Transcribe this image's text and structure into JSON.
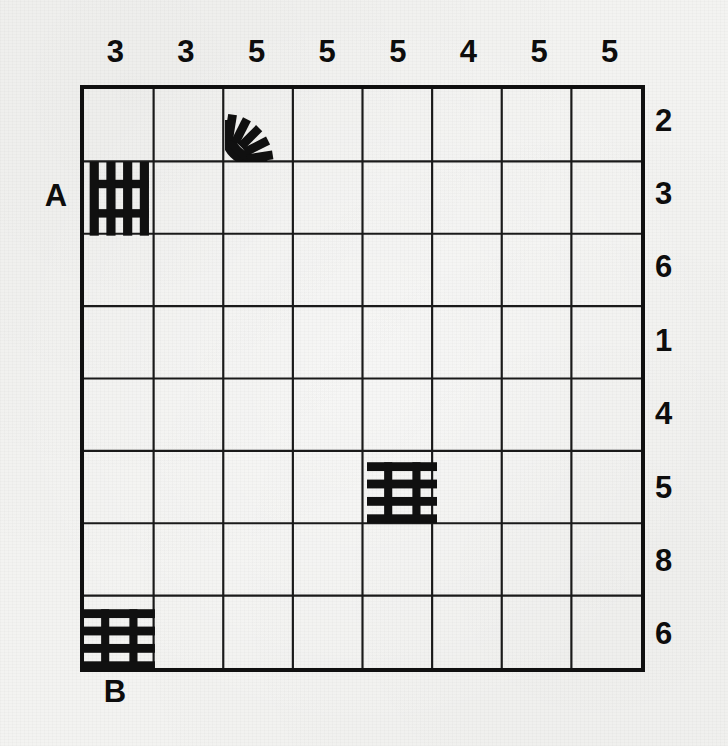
{
  "puzzle": {
    "type": "railroad-track-logic-puzzle",
    "grid": {
      "columns": 8,
      "rows": 8
    },
    "column_clues": [
      3,
      3,
      5,
      5,
      5,
      4,
      5,
      5
    ],
    "row_clues": [
      2,
      3,
      6,
      1,
      4,
      5,
      8,
      6
    ],
    "endpoints": [
      {
        "id": "A",
        "label": "A",
        "side": "left",
        "row": 2
      },
      {
        "id": "B",
        "label": "B",
        "side": "bottom",
        "column": 1
      }
    ],
    "given_tracks": [
      {
        "row": 1,
        "column": 3,
        "shape": "curve",
        "connects": [
          "left",
          "down"
        ],
        "name": "track-curve-r1c3"
      },
      {
        "row": 2,
        "column": 1,
        "shape": "horizontal",
        "connects": [
          "left",
          "right"
        ],
        "name": "track-horizontal-r2c1"
      },
      {
        "row": 6,
        "column": 5,
        "shape": "vertical",
        "connects": [
          "up",
          "down"
        ],
        "name": "track-vertical-r6c5"
      },
      {
        "row": 8,
        "column": 1,
        "shape": "vertical",
        "connects": [
          "up",
          "down"
        ],
        "name": "track-vertical-r8c1"
      }
    ],
    "colors": {
      "ink": "#101010",
      "paper": "#f3f3f1",
      "grid_line": "#1a1a1a"
    }
  }
}
